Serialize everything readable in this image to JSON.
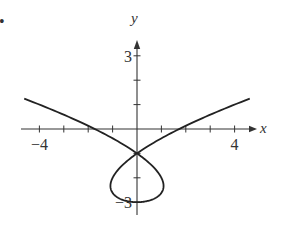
{
  "chart_data": {
    "type": "line",
    "title": "",
    "xlabel": "x",
    "ylabel": "y",
    "bullet": "•",
    "x_ticks": [
      -4,
      -3,
      -2,
      -1,
      1,
      2,
      3,
      4
    ],
    "y_ticks": [
      -3,
      -2,
      -1,
      1,
      2,
      3
    ],
    "x_tick_labels": [
      {
        "value": -4,
        "label": "−4"
      },
      {
        "value": 4,
        "label": "4"
      }
    ],
    "y_tick_labels": [
      {
        "value": 3,
        "label": "3"
      },
      {
        "value": -3,
        "label": "−3"
      }
    ],
    "xlim": [
      -4.8,
      4.8
    ],
    "ylim": [
      -3.2,
      3.4
    ],
    "grid": false,
    "legend": null,
    "curve": {
      "description": "Parametric curve with a self-intersection loop below the origin",
      "parametric": "x = t^3 - 2t, y = t^2 - 3",
      "t_range": [
        -2.06,
        2.06
      ],
      "self_intersection": [
        0,
        -1
      ],
      "loop_bottom": [
        0,
        -3
      ],
      "x_intercepts": [
        -1.9,
        1.9
      ],
      "endpoints": [
        [
          -4.7,
          1.3
        ],
        [
          4.7,
          1.3
        ]
      ]
    },
    "colors": {
      "axis": "#333333",
      "curve": "#222222"
    }
  }
}
